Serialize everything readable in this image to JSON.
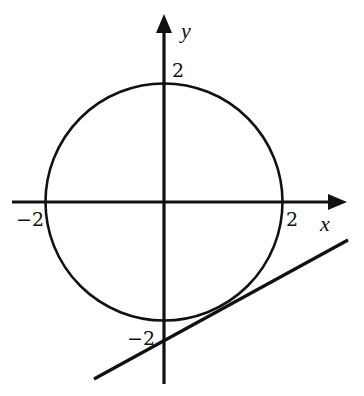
{
  "diagram": {
    "axes": {
      "x_label": "x",
      "y_label": "y"
    },
    "tick_labels": {
      "x_pos": "2",
      "x_neg": "−2",
      "y_pos": "2",
      "y_neg": "−2"
    },
    "circle": {
      "center": [
        0,
        0
      ],
      "radius": 2
    },
    "tangent_line": {
      "touches_circle": "fourth quadrant",
      "crosses_y_axis_below": -2
    },
    "colors": {
      "stroke": "#111111",
      "background": "#ffffff"
    }
  }
}
